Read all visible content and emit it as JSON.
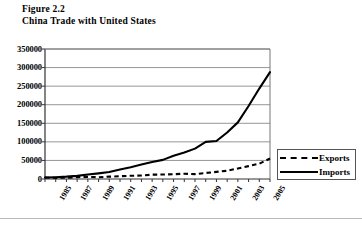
{
  "figure": {
    "label": "Figure 2.2",
    "title": "China Trade with United States"
  },
  "legend": {
    "exports_label": "Exports",
    "imports_label": "Imports"
  },
  "chart_data": {
    "type": "line",
    "title": "China Trade with United States",
    "figure_number": "Figure 2.2",
    "xlabel": "",
    "ylabel": "",
    "ylim": [
      0,
      350000
    ],
    "ytick_step": 50000,
    "yticks": [
      "0",
      "50000",
      "100000",
      "150000",
      "200000",
      "250000",
      "300000",
      "350000"
    ],
    "grid": true,
    "legend_position": "right-outside",
    "xlim": [
      1985,
      2006
    ],
    "xtick_labels": [
      "1985",
      "1987",
      "1989",
      "1991",
      "1993",
      "1995",
      "1997",
      "1999",
      "2001",
      "2003",
      "2005"
    ],
    "x": [
      1985,
      1986,
      1987,
      1988,
      1989,
      1990,
      1991,
      1992,
      1993,
      1994,
      1995,
      1996,
      1997,
      1998,
      1999,
      2000,
      2001,
      2002,
      2003,
      2004,
      2005,
      2006
    ],
    "series": [
      {
        "name": "Exports",
        "style": "dashed",
        "color": "#000000",
        "values": [
          3856,
          3106,
          3497,
          5022,
          5755,
          4806,
          6287,
          7470,
          8763,
          9282,
          11754,
          11993,
          12862,
          14241,
          13111,
          16185,
          19182,
          22128,
          28368,
          34744,
          41192,
          55224
        ]
      },
      {
        "name": "Imports",
        "style": "solid",
        "color": "#000000",
        "values": [
          3862,
          4771,
          6294,
          8511,
          11990,
          15237,
          18969,
          25728,
          31540,
          38787,
          45543,
          51513,
          62558,
          71169,
          81788,
          100018,
          102278,
          125193,
          152436,
          196682,
          243470,
          287774
        ]
      }
    ]
  }
}
